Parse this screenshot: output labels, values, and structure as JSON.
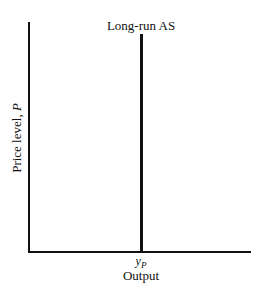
{
  "chart_data": {
    "type": "line",
    "title": "",
    "xlabel": "Output",
    "ylabel": "Price level, P",
    "ylabel_prefix": "Price level, ",
    "ylabel_var": "P",
    "x_ticks": [
      "y_P"
    ],
    "x_tick_base": "y",
    "x_tick_sub": "P",
    "series": [
      {
        "name": "Long-run AS",
        "type": "vertical_line",
        "x": "y_P",
        "annotation": "Long-run AS"
      }
    ],
    "grid": false,
    "legend": "none"
  }
}
